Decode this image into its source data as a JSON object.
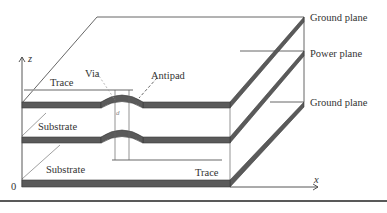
{
  "diagram": {
    "type": "pcb-stackup-3d",
    "labels": {
      "ground_plane_top": "Ground plane",
      "power_plane": "Power plane",
      "ground_plane_bottom": "Ground plane",
      "trace_top": "Trace",
      "via": "Via",
      "antipad": "Antipad",
      "substrate_upper": "Substrate",
      "substrate_lower": "Substrate",
      "trace_bottom": "Trace",
      "via_diameter": "d",
      "axis_z": "z",
      "axis_x": "x",
      "origin": "0"
    },
    "colors": {
      "plane_fill": "#5a5a5a",
      "plane_edge": "#3a3a3a",
      "trace_line": "#9a9a9a",
      "outline": "#555555",
      "bottom_rule": "#222222"
    }
  }
}
